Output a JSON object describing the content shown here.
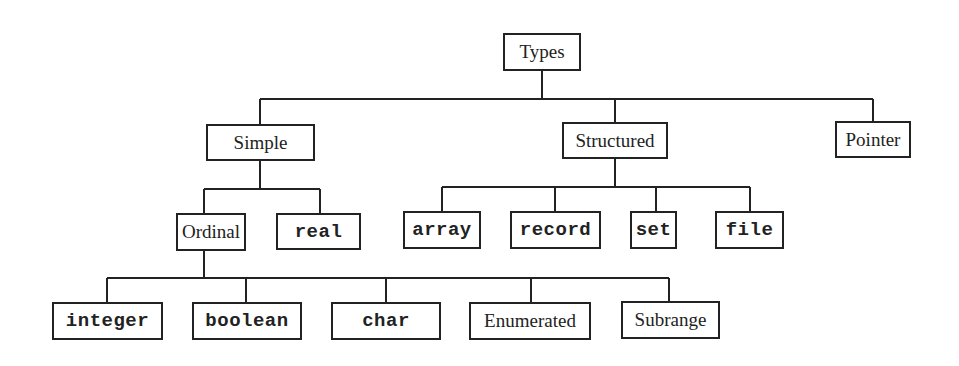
{
  "diagram": {
    "title": "Types",
    "type": "tree",
    "root": "Types",
    "nodes": {
      "types": {
        "label": "Types",
        "style": "serif"
      },
      "simple": {
        "label": "Simple",
        "style": "serif"
      },
      "structured": {
        "label": "Structured",
        "style": "serif"
      },
      "pointer": {
        "label": "Pointer",
        "style": "serif"
      },
      "ordinal": {
        "label": "Ordinal",
        "style": "serif"
      },
      "real": {
        "label": "real",
        "style": "mono"
      },
      "array": {
        "label": "array",
        "style": "mono"
      },
      "record": {
        "label": "record",
        "style": "mono"
      },
      "set": {
        "label": "set",
        "style": "mono"
      },
      "file": {
        "label": "file",
        "style": "mono"
      },
      "integer": {
        "label": "integer",
        "style": "mono"
      },
      "boolean": {
        "label": "boolean",
        "style": "mono"
      },
      "char": {
        "label": "char",
        "style": "mono"
      },
      "enumerated": {
        "label": "Enumerated",
        "style": "serif"
      },
      "subrange": {
        "label": "Subrange",
        "style": "serif"
      }
    },
    "edges": [
      [
        "Types",
        "Simple"
      ],
      [
        "Types",
        "Structured"
      ],
      [
        "Types",
        "Pointer"
      ],
      [
        "Simple",
        "Ordinal"
      ],
      [
        "Simple",
        "real"
      ],
      [
        "Structured",
        "array"
      ],
      [
        "Structured",
        "record"
      ],
      [
        "Structured",
        "set"
      ],
      [
        "Structured",
        "file"
      ],
      [
        "Ordinal",
        "integer"
      ],
      [
        "Ordinal",
        "boolean"
      ],
      [
        "Ordinal",
        "char"
      ],
      [
        "Ordinal",
        "Enumerated"
      ],
      [
        "Ordinal",
        "Subrange"
      ]
    ],
    "colors": {
      "line": "#222222",
      "background": "#ffffff"
    }
  }
}
